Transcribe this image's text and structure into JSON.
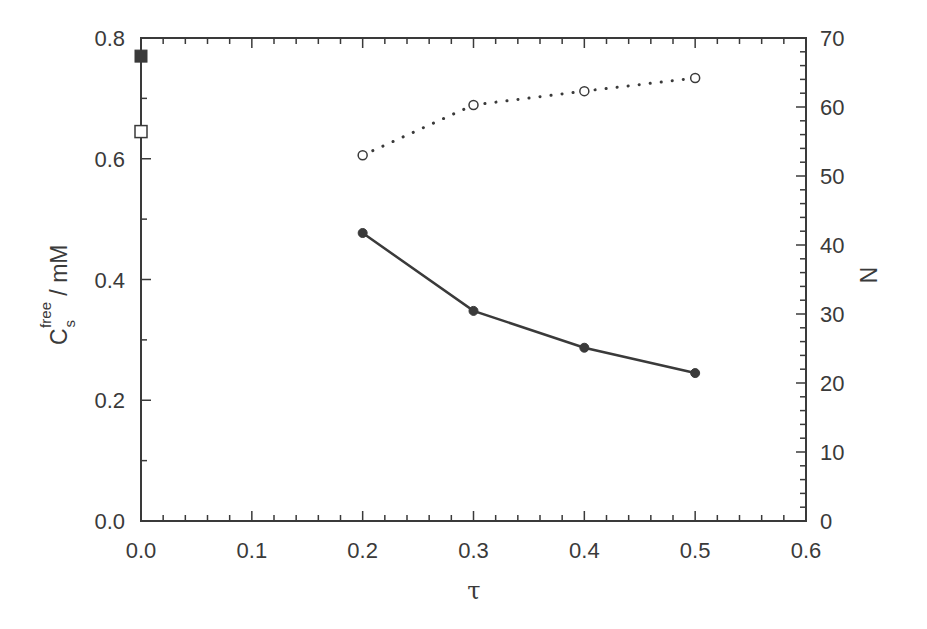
{
  "chart_data": {
    "type": "line",
    "title": "",
    "xlabel": "τ",
    "ylabel": "C_s^free / mM",
    "ylabel_parts": {
      "main": "C",
      "sub": "s",
      "sup": "free",
      "unit": " / mM"
    },
    "y2label": "N",
    "xlim": [
      0.0,
      0.6
    ],
    "ylim": [
      0.0,
      0.8
    ],
    "y2lim": [
      0,
      70
    ],
    "grid": false,
    "legend": null,
    "x_ticks": [
      "0.0",
      "0.1",
      "0.2",
      "0.3",
      "0.4",
      "0.5",
      "0.6"
    ],
    "y_ticks": [
      "0.0",
      "0.2",
      "0.4",
      "0.6",
      "0.8"
    ],
    "y2_ticks": [
      "0",
      "10",
      "20",
      "30",
      "40",
      "50",
      "60",
      "70"
    ],
    "series": [
      {
        "name": "C_s^free (filled circles, solid line)",
        "axis": "left",
        "marker": "filled-circle",
        "line": "solid",
        "x": [
          0.2,
          0.3,
          0.4,
          0.5
        ],
        "values": [
          0.477,
          0.348,
          0.287,
          0.245
        ]
      },
      {
        "name": "N (open circles, dotted line)",
        "axis": "right",
        "marker": "open-circle",
        "line": "dotted",
        "x": [
          0.2,
          0.3,
          0.4,
          0.5
        ],
        "values": [
          53.0,
          60.3,
          62.3,
          64.2
        ]
      },
      {
        "name": "C_s^free at τ=0 (filled square)",
        "axis": "left",
        "marker": "filled-square",
        "line": "none",
        "x": [
          0.0
        ],
        "values": [
          0.77
        ]
      },
      {
        "name": "C_s^free at τ=0 (open square)",
        "axis": "left",
        "marker": "open-square",
        "line": "none",
        "x": [
          0.0
        ],
        "values": [
          0.645
        ]
      }
    ]
  },
  "colors": {
    "ink": "#3a3a3a",
    "background": "#ffffff"
  }
}
